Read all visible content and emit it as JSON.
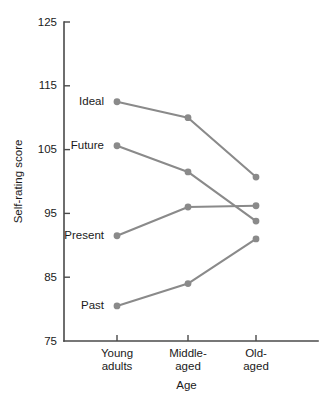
{
  "chart_data": {
    "type": "line",
    "title": "",
    "xlabel": "Age",
    "ylabel": "Self-rating score",
    "categories": [
      "Young adults",
      "Middle-aged",
      "Old-aged"
    ],
    "category_lines": [
      [
        "Young",
        "adults"
      ],
      [
        "Middle-",
        "aged"
      ],
      [
        "Old-",
        "aged"
      ]
    ],
    "ylim": [
      75,
      125
    ],
    "yticks": [
      75,
      85,
      95,
      105,
      115,
      125
    ],
    "ytick_labels": [
      "75",
      "85",
      "95",
      "105",
      "115",
      "125"
    ],
    "grid": false,
    "legend_position": "inline-left-of-first-point",
    "series_color": "#8a8a8a",
    "series": [
      {
        "name": "Ideal",
        "label": "Ideal",
        "values": [
          112.5,
          110.0,
          100.7
        ]
      },
      {
        "name": "Future",
        "label": "Future",
        "values": [
          105.6,
          101.5,
          93.8
        ]
      },
      {
        "name": "Present",
        "label": "Present",
        "values": [
          91.5,
          96.0,
          96.2
        ]
      },
      {
        "name": "Past",
        "label": "Past",
        "values": [
          80.5,
          84.0,
          91.0
        ]
      }
    ]
  }
}
